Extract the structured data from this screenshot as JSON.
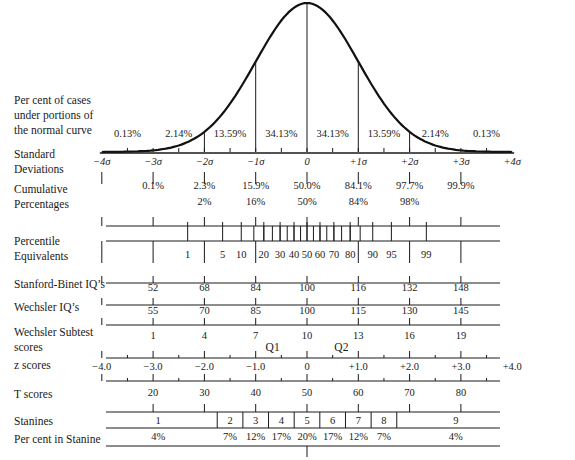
{
  "chart_data": {
    "type": "line",
    "curve": {
      "distribution": "normal",
      "mean": 0,
      "sd": 1,
      "x_range": [
        -4,
        4
      ]
    },
    "rows": {
      "percent_under_curve": {
        "label": [
          "Per cent of cases",
          "under portions of",
          "the normal curve"
        ],
        "values": [
          "0.13%",
          "2.14%",
          "13.59%",
          "34.13%",
          "34.13%",
          "13.59%",
          "2.14%",
          "0.13%"
        ]
      },
      "standard_deviations": {
        "label": [
          "Standard",
          "Deviations"
        ],
        "ticks": [
          "−4σ",
          "−3σ",
          "−2σ",
          "−1σ",
          "0",
          "+1σ",
          "+2σ",
          "+3σ",
          "+4σ"
        ]
      },
      "cumulative_percentages": {
        "label": [
          "Cumulative",
          "Percentages"
        ],
        "values": [
          "0.1%",
          "2.3%",
          "15.9%",
          "50.0%",
          "84.1%",
          "97.7%",
          "99.9%"
        ],
        "rounded": [
          "2%",
          "16%",
          "50%",
          "84%",
          "98%"
        ]
      },
      "percentile_equivalents": {
        "label": [
          "Percentile",
          "Equivalents"
        ],
        "ticks": [
          "1",
          "5",
          "10",
          "20",
          "30",
          "40",
          "50",
          "60",
          "70",
          "80",
          "90",
          "95",
          "99"
        ]
      },
      "stanford_binet": {
        "label": "Stanford-Binet IQ’s",
        "ticks": [
          "52",
          "68",
          "84",
          "100",
          "116",
          "132",
          "148"
        ]
      },
      "wechsler_iq": {
        "label": "Wechsler IQ’s",
        "ticks": [
          "55",
          "70",
          "85",
          "100",
          "115",
          "130",
          "145"
        ]
      },
      "wechsler_subtest": {
        "label": [
          "Wechsler Subtest",
          "scores"
        ],
        "ticks": [
          "1",
          "4",
          "7",
          "10",
          "13",
          "16",
          "19"
        ]
      },
      "z_scores": {
        "label": "z scores",
        "ticks": [
          "−4.0",
          "−3.0",
          "−2.0",
          "−1.0",
          "0",
          "+1.0",
          "+2.0",
          "+3.0",
          "+4.0"
        ],
        "quartiles": [
          "Q1",
          "Q2"
        ]
      },
      "t_scores": {
        "label": "T scores",
        "ticks": [
          "20",
          "30",
          "40",
          "50",
          "60",
          "70",
          "80"
        ]
      },
      "stanines": {
        "label": "Stanines",
        "values": [
          "1",
          "2",
          "3",
          "4",
          "5",
          "6",
          "7",
          "8",
          "9"
        ]
      },
      "percent_in_stanine": {
        "label": "Per cent in Stanine",
        "values": [
          "4%",
          "7%",
          "12%",
          "17%",
          "20%",
          "17%",
          "12%",
          "7%",
          "4%"
        ]
      }
    }
  }
}
